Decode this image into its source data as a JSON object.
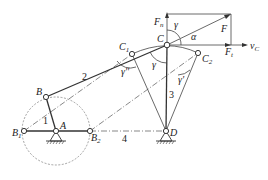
{
  "diagram": {
    "type": "four-bar linkage transmission/pressure angle diagram",
    "points": {
      "A": {
        "label": "A",
        "x": 56,
        "y": 131
      },
      "B": {
        "label": "B",
        "x": 46,
        "y": 97
      },
      "B1": {
        "label": "B",
        "sub": "1",
        "x": 24,
        "y": 131
      },
      "B2": {
        "label": "B",
        "sub": "2",
        "x": 90,
        "y": 131
      },
      "C": {
        "label": "C",
        "x": 167,
        "y": 45
      },
      "C1": {
        "label": "C",
        "sub": "1",
        "x": 132,
        "y": 54
      },
      "C2": {
        "label": "C",
        "sub": "2",
        "x": 198,
        "y": 53
      },
      "D": {
        "label": "D",
        "x": 166,
        "y": 131
      }
    },
    "links": [
      {
        "id": "1",
        "label": "1",
        "from": "A",
        "to": "B"
      },
      {
        "id": "2",
        "label": "2",
        "from": "B",
        "to": "C"
      },
      {
        "id": "3",
        "label": "3",
        "from": "C",
        "to": "D"
      },
      {
        "id": "4",
        "label": "4",
        "from": "A",
        "to": "D"
      }
    ],
    "forces": {
      "F": "F",
      "Fn": {
        "label": "F",
        "sub": "n"
      },
      "Ft": {
        "label": "F",
        "sub": "t"
      },
      "vC": {
        "label": "v",
        "sub": "C"
      }
    },
    "angles": {
      "alpha": "α",
      "gamma_top": "γ",
      "gamma": "γ",
      "gamma_pp": "γ''",
      "gamma_p": "γ'"
    }
  }
}
